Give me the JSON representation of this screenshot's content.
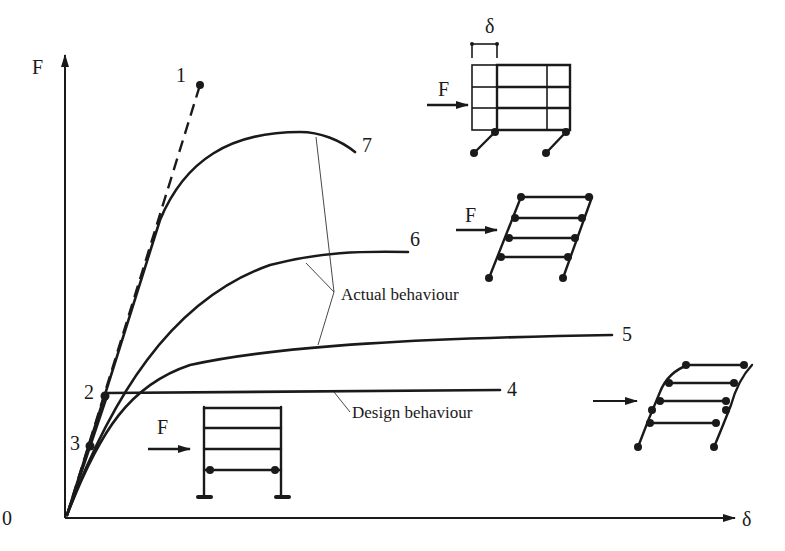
{
  "axes": {
    "y_label": "F",
    "x_label": "δ",
    "origin_label": "0"
  },
  "curves": [
    {
      "id": "1",
      "label": "1",
      "style": "dashed",
      "description": "elastic"
    },
    {
      "id": "2",
      "label": "2",
      "style": "point"
    },
    {
      "id": "3",
      "label": "3",
      "style": "point"
    },
    {
      "id": "4",
      "label": "4",
      "style": "solid"
    },
    {
      "id": "5",
      "label": "5",
      "style": "solid"
    },
    {
      "id": "6",
      "label": "6",
      "style": "solid"
    },
    {
      "id": "7",
      "label": "7",
      "style": "solid"
    }
  ],
  "annotations": {
    "actual": "Actual behaviour",
    "design": "Design behaviour"
  },
  "frames": {
    "top": {
      "force_label": "F",
      "disp_label": "δ"
    },
    "middle": {
      "force_label": "F"
    },
    "bottom_left": {
      "force_label": "F"
    },
    "bottom_right": {
      "force_label": ""
    }
  },
  "colors": {
    "ink": "#1a1a1a",
    "background": "#ffffff"
  }
}
